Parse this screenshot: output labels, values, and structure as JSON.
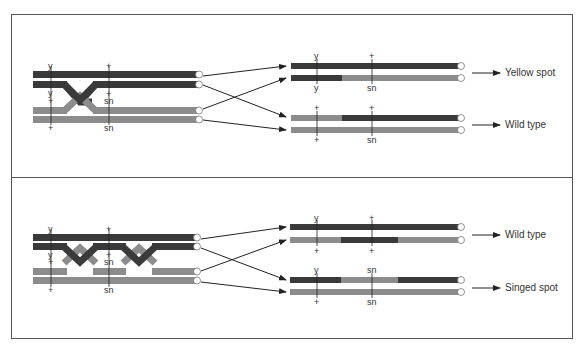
{
  "colors": {
    "dark": "#3a3a3a",
    "light": "#8c8c8c",
    "line": "#222222",
    "frame": "#555555"
  },
  "panels": [
    {
      "name": "single-crossover",
      "top_marker_labels": {
        "y": "y",
        "plus": "+"
      },
      "mid_upper_labels": {
        "y": "y",
        "plus": "+"
      },
      "mid_lower_labels": {
        "plus": "+",
        "sn": "sn"
      },
      "bottom_labels": {
        "plus": "+",
        "sn": "sn"
      },
      "results": [
        {
          "above": [
            "y",
            "+"
          ],
          "below": [
            "y",
            "sn"
          ],
          "outcome": "Yellow spot"
        },
        {
          "above": [
            "+",
            "+"
          ],
          "below": [
            "+",
            "sn"
          ],
          "outcome": "Wild type"
        }
      ]
    },
    {
      "name": "double-crossover",
      "top_marker_labels": {
        "y": "y",
        "plus": "+"
      },
      "mid_upper_labels": {
        "y": "y",
        "plus": "+"
      },
      "mid_lower_labels": {
        "plus": "+",
        "sn": "sn"
      },
      "bottom_labels": {
        "plus": "+",
        "sn": "sn"
      },
      "results": [
        {
          "above": [
            "y",
            "+"
          ],
          "below": [
            "+",
            "+"
          ],
          "outcome": "Wild type"
        },
        {
          "above": [
            "y",
            "sn"
          ],
          "below": [
            "+",
            "sn"
          ],
          "outcome": "Singed spot"
        }
      ]
    }
  ]
}
